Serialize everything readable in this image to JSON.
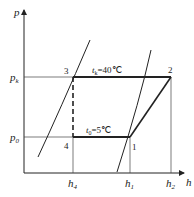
{
  "diagram": {
    "type": "p-h refrigeration cycle",
    "axes": {
      "y_label": "p",
      "x_label": "h",
      "y_ticks": [
        {
          "main": "p",
          "sub": "k"
        },
        {
          "main": "p",
          "sub": "0"
        }
      ],
      "x_ticks": [
        {
          "main": "h",
          "sub": "4"
        },
        {
          "main": "h",
          "sub": "1"
        },
        {
          "main": "h",
          "sub": "2"
        }
      ]
    },
    "points": [
      "1",
      "2",
      "3",
      "4"
    ],
    "annotations": {
      "condensing": {
        "main": "t",
        "sub": "k",
        "rest": "=40℃"
      },
      "evaporating": {
        "main": "t",
        "sub": "0",
        "rest": "=5℃"
      }
    },
    "colors": {
      "line": "#222222",
      "background": "#ffffff"
    }
  }
}
